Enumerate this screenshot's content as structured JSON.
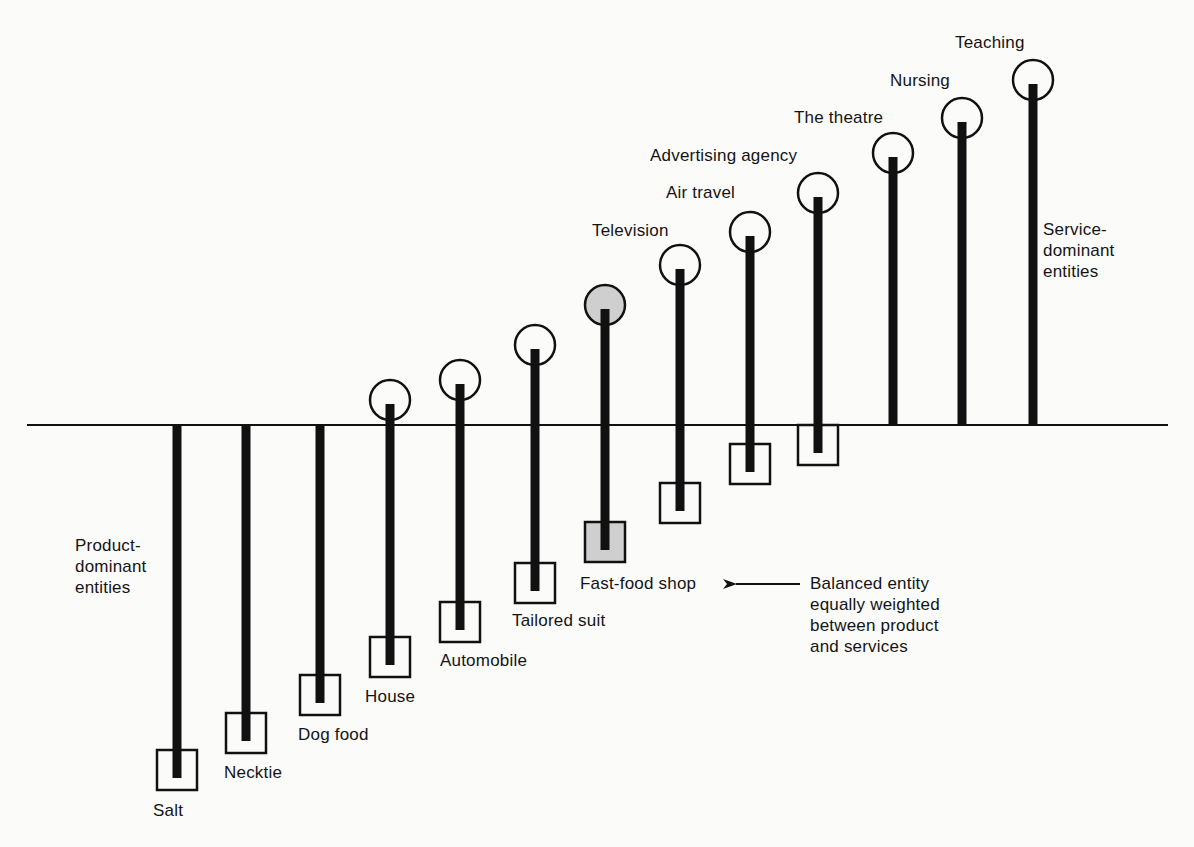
{
  "diagram": {
    "title": "",
    "baseline": {
      "x1": 27,
      "x2": 1168,
      "y": 425
    },
    "colors": {
      "ink": "#111111",
      "background": "#fbfbfa",
      "highlight_fill": "#cfcfcf"
    },
    "entities": [
      {
        "name": "Salt",
        "x": 177,
        "circle_y": null,
        "square_y": 770,
        "highlight": false,
        "label_x": 153,
        "label_y": 800
      },
      {
        "name": "Necktie",
        "x": 246,
        "circle_y": null,
        "square_y": 733,
        "highlight": false,
        "label_x": 224,
        "label_y": 762
      },
      {
        "name": "Dog food",
        "x": 320,
        "circle_y": null,
        "square_y": 695,
        "highlight": false,
        "label_x": 298,
        "label_y": 724
      },
      {
        "name": "House",
        "x": 390,
        "circle_y": 400,
        "square_y": 657,
        "highlight": false,
        "label_x": 365,
        "label_y": 686
      },
      {
        "name": "Automobile",
        "x": 460,
        "circle_y": 380,
        "square_y": 622,
        "highlight": false,
        "label_x": 440,
        "label_y": 650
      },
      {
        "name": "Tailored suit",
        "x": 535,
        "circle_y": 345,
        "square_y": 583,
        "highlight": false,
        "label_x": 512,
        "label_y": 610
      },
      {
        "name": "Fast-food shop",
        "x": 605,
        "circle_y": 305,
        "square_y": 542,
        "highlight": true,
        "label_x": 580,
        "label_y": 573
      },
      {
        "name": "Television",
        "x": 680,
        "circle_y": 265,
        "square_y": 503,
        "highlight": false,
        "label_x": 592,
        "label_y": 220
      },
      {
        "name": "Air travel",
        "x": 750,
        "circle_y": 232,
        "square_y": 464,
        "highlight": false,
        "label_x": 666,
        "label_y": 182
      },
      {
        "name": "Advertising agency",
        "x": 818,
        "circle_y": 193,
        "square_y": 445,
        "highlight": false,
        "label_x": 650,
        "label_y": 145
      },
      {
        "name": "The theatre",
        "x": 893,
        "circle_y": 153,
        "square_y": null,
        "highlight": false,
        "label_x": 794,
        "label_y": 107
      },
      {
        "name": "Nursing",
        "x": 962,
        "circle_y": 118,
        "square_y": null,
        "highlight": false,
        "label_x": 890,
        "label_y": 70
      },
      {
        "name": "Teaching",
        "x": 1033,
        "circle_y": 80,
        "square_y": null,
        "highlight": false,
        "label_x": 955,
        "label_y": 32
      }
    ],
    "annotations": {
      "product_dominant": {
        "lines": [
          "Product-",
          "dominant",
          "entities"
        ],
        "x": 75,
        "y": 535
      },
      "service_dominant": {
        "lines": [
          "Service-",
          "dominant",
          "entities"
        ],
        "x": 1043,
        "y": 219
      },
      "balanced": {
        "lines": [
          "Balanced entity",
          "equally weighted",
          "between product",
          "and services"
        ],
        "x": 810,
        "y": 573
      },
      "arrow": {
        "x1": 800,
        "x2": 722,
        "y": 584,
        "points_to": "Fast-food shop"
      }
    },
    "legend": {
      "circle_meaning": "service component",
      "square_meaning": "product component"
    }
  }
}
